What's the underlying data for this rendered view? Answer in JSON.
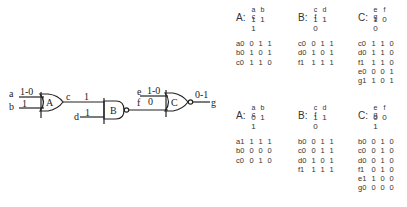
{
  "circuit": {
    "gates": [
      {
        "name": "A",
        "type": "OR"
      },
      {
        "name": "B",
        "type": "NAND"
      },
      {
        "name": "C",
        "type": "NOR"
      }
    ],
    "signals": {
      "a": {
        "label": "a",
        "value": "1-0"
      },
      "b": {
        "label": "b",
        "value": "1"
      },
      "c": {
        "label": "c",
        "value": "1"
      },
      "d": {
        "label": "d",
        "value": "1"
      },
      "e": {
        "label": "e",
        "value": "1-0"
      },
      "f": {
        "label": "f",
        "value": "0"
      },
      "g": {
        "label": "g",
        "value": "0-1"
      }
    }
  },
  "tables_top": [
    {
      "gate": "A:",
      "vars": [
        "a",
        "b",
        "c"
      ],
      "values": [
        "1",
        "1",
        "1"
      ],
      "rows": [
        {
          "label": "a0",
          "cells": [
            "0",
            "1",
            "1"
          ]
        },
        {
          "label": "b0",
          "cells": [
            "1",
            "0",
            "1"
          ]
        },
        {
          "label": "c0",
          "cells": [
            "1",
            "1",
            "0"
          ]
        }
      ]
    },
    {
      "gate": "B:",
      "vars": [
        "c",
        "d",
        "f"
      ],
      "values": [
        "1",
        "1",
        "0"
      ],
      "rows": [
        {
          "label": "c0",
          "cells": [
            "0",
            "1",
            "1"
          ]
        },
        {
          "label": "d0",
          "cells": [
            "1",
            "0",
            "1"
          ]
        },
        {
          "label": "f1",
          "cells": [
            "1",
            "1",
            "1"
          ]
        }
      ]
    },
    {
      "gate": "C:",
      "vars": [
        "e",
        "f",
        "g"
      ],
      "values": [
        "1",
        "0",
        "0"
      ],
      "rows": [
        {
          "label": "c0",
          "cells": [
            "1",
            "1",
            "0"
          ]
        },
        {
          "label": "d0",
          "cells": [
            "1",
            "1",
            "0"
          ]
        },
        {
          "label": "f1",
          "cells": [
            "1",
            "1",
            "0"
          ]
        },
        {
          "label": "e0",
          "cells": [
            "0",
            "0",
            "1"
          ]
        },
        {
          "label": "g1",
          "cells": [
            "1",
            "0",
            "1"
          ]
        }
      ]
    }
  ],
  "tables_bottom": [
    {
      "gate": "A:",
      "vars": [
        "a",
        "b",
        "c"
      ],
      "values": [
        "0",
        "1",
        "1"
      ],
      "rows": [
        {
          "label": "a1",
          "cells": [
            "1",
            "1",
            "1"
          ]
        },
        {
          "label": "b0",
          "cells": [
            "0",
            "0",
            "0"
          ]
        },
        {
          "label": "c0",
          "cells": [
            "0",
            "1",
            "0"
          ]
        }
      ]
    },
    {
      "gate": "B:",
      "vars": [
        "c",
        "d",
        "f"
      ],
      "values": [
        "1",
        "1",
        "0"
      ],
      "rows": [
        {
          "label": "b0",
          "cells": [
            "0",
            "1",
            "1"
          ]
        },
        {
          "label": "c0",
          "cells": [
            "0",
            "1",
            "1"
          ]
        },
        {
          "label": "d0",
          "cells": [
            "1",
            "0",
            "1"
          ]
        },
        {
          "label": "f1",
          "cells": [
            "1",
            "1",
            "1"
          ]
        }
      ]
    },
    {
      "gate": "C:",
      "vars": [
        "e",
        "f",
        "g"
      ],
      "values": [
        "0",
        "0",
        "1"
      ],
      "rows": [
        {
          "label": "b0",
          "cells": [
            "0",
            "1",
            "0"
          ]
        },
        {
          "label": "c0",
          "cells": [
            "0",
            "1",
            "0"
          ]
        },
        {
          "label": "d0",
          "cells": [
            "0",
            "1",
            "0"
          ]
        },
        {
          "label": "f1",
          "cells": [
            "0",
            "1",
            "0"
          ]
        },
        {
          "label": "e1",
          "cells": [
            "1",
            "0",
            "0"
          ]
        },
        {
          "label": "g0",
          "cells": [
            "0",
            "0",
            "0"
          ]
        }
      ]
    }
  ]
}
